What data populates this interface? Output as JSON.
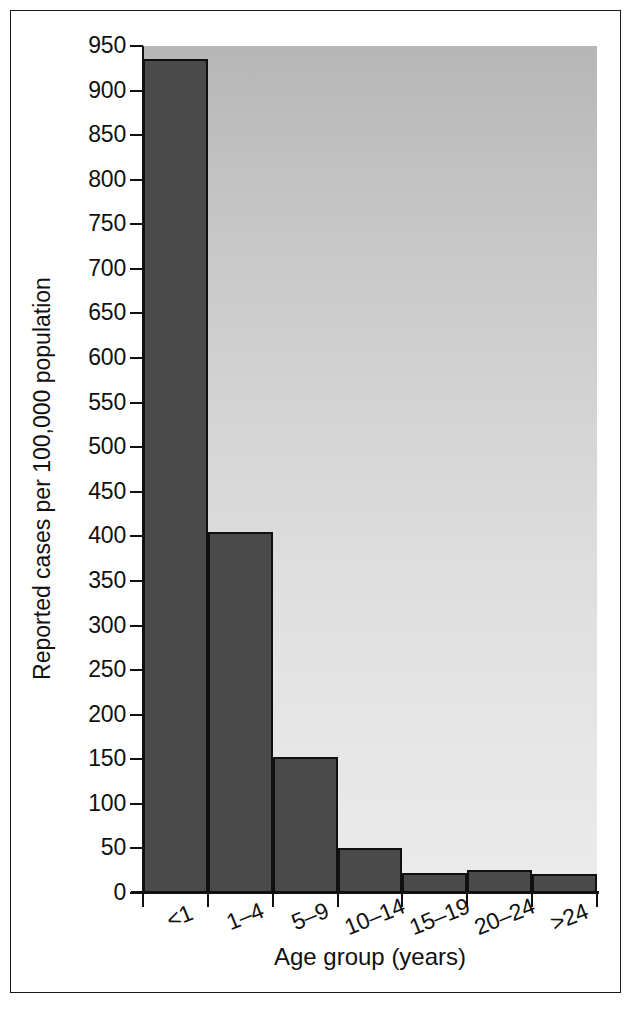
{
  "chart_data": {
    "type": "bar",
    "title": "",
    "xlabel": "Age group (years)",
    "ylabel": "Reported cases per 100,000 population",
    "categories": [
      "<1",
      "1–4",
      "5–9",
      "10–14",
      "15–19",
      "20–24",
      ">24"
    ],
    "values": [
      935,
      405,
      152,
      51,
      22,
      26,
      21
    ],
    "ylim": [
      0,
      950
    ],
    "yticks": [
      0,
      50,
      100,
      150,
      200,
      250,
      300,
      350,
      400,
      450,
      500,
      550,
      600,
      650,
      700,
      750,
      800,
      850,
      900,
      950
    ],
    "ytick_labels": [
      "0",
      "50",
      "100",
      "150",
      "200",
      "250",
      "300",
      "350",
      "400",
      "450",
      "500",
      "550",
      "600",
      "650",
      "700",
      "750",
      "800",
      "850",
      "900",
      "950"
    ],
    "grid": false,
    "legend": false,
    "legend_position": "none",
    "bar_color": "#4a4a4a",
    "bar_edge_color": "#101010",
    "plot_background": "#d2d2d2",
    "figure_background": "#ffffff",
    "axis_color": "#111111",
    "xtick_mode": "bar-boundaries"
  },
  "figure": {
    "frame_border_color": "#1a1a1a"
  }
}
